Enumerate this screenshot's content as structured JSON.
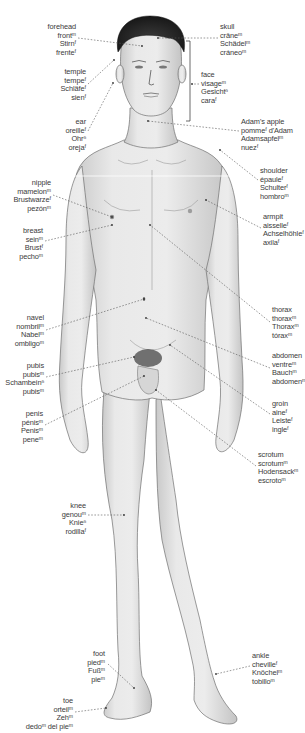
{
  "diagram": {
    "title": "",
    "colors": {
      "skin": "#e6e6e6",
      "skin_shadow": "#bdbdbd",
      "outline": "#6a6a6a",
      "hair": "#1c1c1c",
      "leader_line": "#555555",
      "text": "#3a3a3a"
    },
    "labels": [
      {
        "id": "forehead",
        "side": "right",
        "x": 76,
        "y": 23,
        "lines": [
          "forehead",
          "frontᵐ",
          "Stirnᶠ",
          "frenteᶠ"
        ],
        "line_from": [
          78,
          38
        ],
        "line_to": [
          142,
          46
        ]
      },
      {
        "id": "temple",
        "side": "right",
        "x": 86,
        "y": 68,
        "lines": [
          "temple",
          "tempeᶠ",
          "Schläfeᶠ",
          "sienᶠ"
        ],
        "line_from": [
          88,
          84
        ],
        "line_to": [
          114,
          60
        ]
      },
      {
        "id": "ear",
        "side": "right",
        "x": 86,
        "y": 118,
        "lines": [
          "ear",
          "oreilleᶠ",
          "Ohrⁿ",
          "orejaᶠ"
        ],
        "line_from": [
          88,
          131
        ],
        "line_to": [
          113,
          83
        ]
      },
      {
        "id": "skull",
        "side": "left",
        "x": 220,
        "y": 23,
        "lines": [
          "skull",
          "crâneᵐ",
          "Schädelᵐ",
          "cráneoᵐ"
        ],
        "line_from": [
          218,
          38
        ],
        "line_to": [
          158,
          38
        ]
      },
      {
        "id": "face",
        "side": "left",
        "x": 201,
        "y": 71,
        "lines": [
          "face",
          "visageᵐ",
          "Gesichtⁿ",
          "caraᶠ"
        ],
        "line_from": [
          199,
          84
        ],
        "line_to": [
          192,
          84
        ]
      },
      {
        "id": "adams-apple",
        "side": "left",
        "x": 241,
        "y": 118,
        "lines": [
          "Adam's apple",
          "pommeᶠ d'Adam",
          "Adamsapfelᵐ",
          "nuezᶠ"
        ],
        "line_from": [
          239,
          131
        ],
        "line_to": [
          148,
          121
        ]
      },
      {
        "id": "shoulder",
        "side": "left",
        "x": 260,
        "y": 167,
        "lines": [
          "shoulder",
          "épauleᶠ",
          "Schulterᶠ",
          "hombroᵐ"
        ],
        "line_from": [
          258,
          180
        ],
        "line_to": [
          220,
          150
        ]
      },
      {
        "id": "armpit",
        "side": "left",
        "x": 263,
        "y": 213,
        "lines": [
          "armpit",
          "aisselleᶠ",
          "Achselhöhleᶠ",
          "axilaᶠ"
        ],
        "line_from": [
          261,
          228
        ],
        "line_to": [
          206,
          200
        ]
      },
      {
        "id": "nipple",
        "side": "right",
        "x": 51,
        "y": 179,
        "lines": [
          "nipple",
          "mamelonᵐ",
          "Brustwarzeᶠ",
          "pezónᵐ"
        ],
        "line_from": [
          53,
          195
        ],
        "line_to": [
          112,
          217
        ]
      },
      {
        "id": "breast",
        "side": "right",
        "x": 43,
        "y": 227,
        "lines": [
          "breast",
          "seinᵐ",
          "Brustᶠ",
          "pechoᵐ"
        ],
        "line_from": [
          45,
          241
        ],
        "line_to": [
          112,
          225
        ]
      },
      {
        "id": "thorax",
        "side": "left",
        "x": 272,
        "y": 306,
        "lines": [
          "thorax",
          "thoraxᵐ",
          "Thoraxᵐ",
          "tóraxᵐ"
        ],
        "line_from": [
          270,
          322
        ],
        "line_to": [
          150,
          225
        ]
      },
      {
        "id": "navel",
        "side": "right",
        "x": 44,
        "y": 314,
        "lines": [
          "navel",
          "nombrilᵐ",
          "Nabelᵐ",
          "ombligoᵐ"
        ],
        "line_from": [
          46,
          330
        ],
        "line_to": [
          144,
          299
        ]
      },
      {
        "id": "abdomen",
        "side": "left",
        "x": 272,
        "y": 352,
        "lines": [
          "abdomen",
          "ventreᵐ",
          "Bauchᵐ",
          "abdomenᵐ"
        ],
        "line_from": [
          270,
          368
        ],
        "line_to": [
          146,
          318
        ]
      },
      {
        "id": "pubis",
        "side": "right",
        "x": 44,
        "y": 362,
        "lines": [
          "pubis",
          "pubisᵐ",
          "Schambeinⁿ",
          "pubisᵐ"
        ],
        "line_from": [
          46,
          377
        ],
        "line_to": [
          134,
          357
        ]
      },
      {
        "id": "groin",
        "side": "left",
        "x": 272,
        "y": 400,
        "lines": [
          "groin",
          "aineᶠ",
          "Leisteᶠ",
          "ingleᶠ"
        ],
        "line_from": [
          270,
          414
        ],
        "line_to": [
          170,
          345
        ]
      },
      {
        "id": "penis",
        "side": "right",
        "x": 43,
        "y": 410,
        "lines": [
          "penis",
          "pénisᵐ",
          "Penisᵐ",
          "peneᵐ"
        ],
        "line_from": [
          45,
          425
        ],
        "line_to": [
          144,
          376
        ]
      },
      {
        "id": "scrotum",
        "side": "left",
        "x": 258,
        "y": 451,
        "lines": [
          "scrotum",
          "scrotumᵐ",
          "Hodensackᵐ",
          "escrotoᵐ"
        ],
        "line_from": [
          256,
          466
        ],
        "line_to": [
          156,
          390
        ]
      },
      {
        "id": "knee",
        "side": "right",
        "x": 86,
        "y": 502,
        "lines": [
          "knee",
          "genouᵐ",
          "Knieⁿ",
          "rodillaᶠ"
        ],
        "line_from": [
          88,
          515
        ],
        "line_to": [
          124,
          515
        ]
      },
      {
        "id": "foot",
        "side": "right",
        "x": 105,
        "y": 650,
        "lines": [
          "foot",
          "piedᵐ",
          "Fußᵐ",
          "pieᵐ"
        ],
        "line_from": [
          108,
          664
        ],
        "line_to": [
          134,
          688
        ]
      },
      {
        "id": "toe",
        "side": "right",
        "x": 73,
        "y": 697,
        "lines": [
          "toe",
          "orteilᵐ",
          "Zehᵐ",
          "dedoᵐ del pieᵐ"
        ],
        "line_from": [
          75,
          712
        ],
        "line_to": [
          106,
          708
        ]
      },
      {
        "id": "ankle",
        "side": "left",
        "x": 252,
        "y": 652,
        "lines": [
          "ankle",
          "chevilleᶠ",
          "Knöchelᵐ",
          "tobilloᵐ"
        ],
        "line_from": [
          250,
          666
        ],
        "line_to": [
          216,
          674
        ]
      }
    ]
  }
}
